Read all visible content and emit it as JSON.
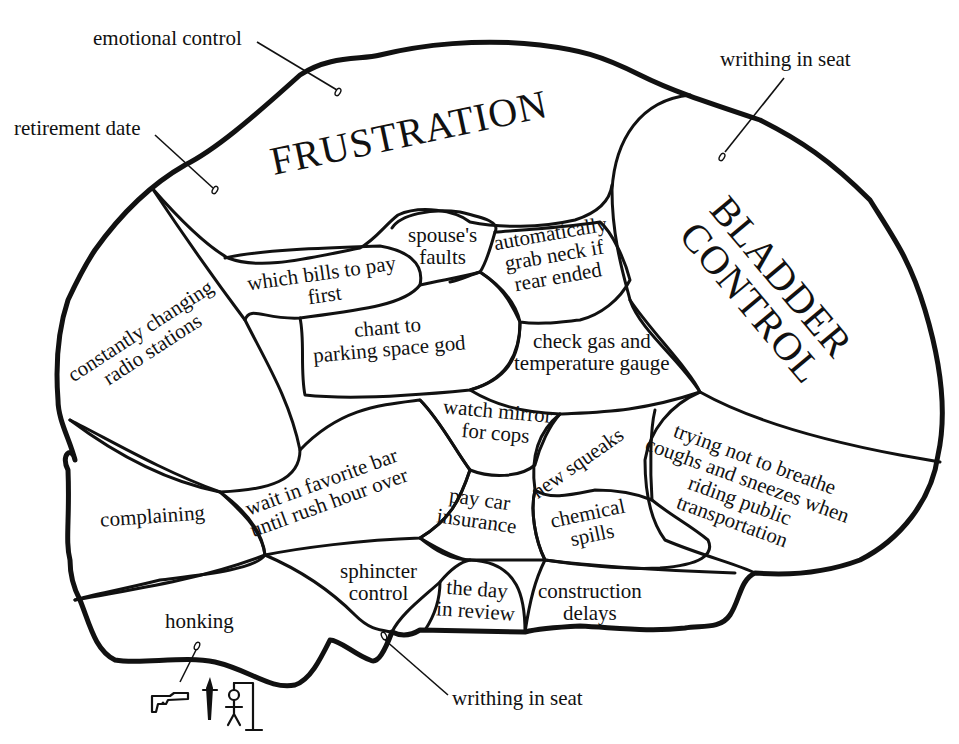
{
  "diagram": {
    "type": "brain-map-cartoon",
    "outer_labels": {
      "emotional_control": "emotional control",
      "retirement_date": "retirement date",
      "writhing_top": "writhing in seat",
      "writhing_bottom": "writhing in seat"
    },
    "regions": {
      "frustration": "FRUSTRATION",
      "bladder_line1": "BLADDER",
      "bladder_line2": "CONTROL",
      "radio_line1": "constantly changing",
      "radio_line2": "radio stations",
      "bills_line1": "which bills to pay",
      "bills_line2": "first",
      "spouse_line1": "spouse's",
      "spouse_line2": "faults",
      "grab_line1": "automatically",
      "grab_line2": "grab neck if",
      "grab_line3": "rear ended",
      "chant_line1": "chant to",
      "chant_line2": "parking space god",
      "gas_line1": "check gas and",
      "gas_line2": "temperature gauge",
      "mirror_line1": "watch mirror",
      "mirror_line2": "for cops",
      "squeaks": "new squeaks",
      "breathe_line1": "trying not to breathe",
      "breathe_line2": "coughs and sneezes when",
      "breathe_line3": "riding public",
      "breathe_line4": "transportation",
      "complaining": "complaining",
      "bar_line1": "wait in favorite bar",
      "bar_line2": "until rush hour over",
      "insurance_line1": "pay car",
      "insurance_line2": "insurance",
      "spills_line1": "chemical",
      "spills_line2": "spills",
      "sphincter_line1": "sphincter",
      "sphincter_line2": "control",
      "review_line1": "the day",
      "review_line2": "in review",
      "construction_line1": "construction",
      "construction_line2": "delays",
      "honking": "honking"
    },
    "icons": [
      "pistol-icon",
      "dagger-icon",
      "gallows-stick-figure-icon"
    ],
    "colors": {
      "ink": "#111111",
      "paper": "#ffffff"
    }
  }
}
